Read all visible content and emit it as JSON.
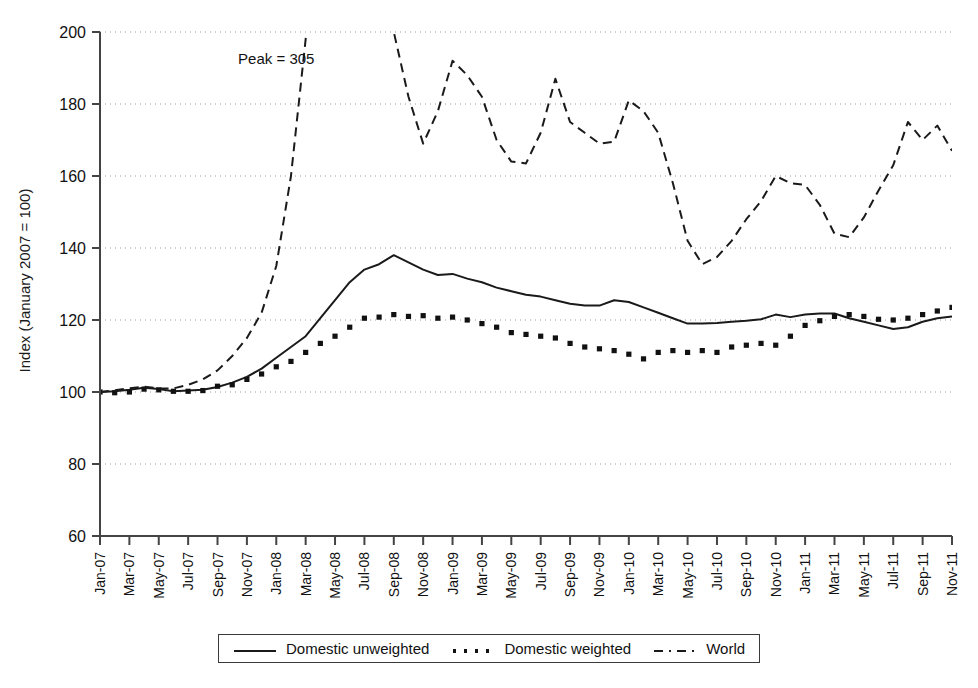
{
  "chart_data": {
    "type": "line",
    "title": "",
    "xlabel": "",
    "ylabel": "Index (January 2007 = 100)",
    "ylim": [
      60,
      200
    ],
    "yticks": [
      60,
      80,
      100,
      120,
      140,
      160,
      180,
      200
    ],
    "grid": true,
    "legend_position": "bottom",
    "annotations": [
      {
        "text": "Peak = 305",
        "x": "Jan-08",
        "y": 191
      }
    ],
    "x": [
      "Jan-07",
      "Feb-07",
      "Mar-07",
      "Apr-07",
      "May-07",
      "Jun-07",
      "Jul-07",
      "Aug-07",
      "Sep-07",
      "Oct-07",
      "Nov-07",
      "Dec-07",
      "Jan-08",
      "Feb-08",
      "Mar-08",
      "Apr-08",
      "May-08",
      "Jun-08",
      "Jul-08",
      "Aug-08",
      "Sep-08",
      "Oct-08",
      "Nov-08",
      "Dec-08",
      "Jan-09",
      "Feb-09",
      "Mar-09",
      "Apr-09",
      "May-09",
      "Jun-09",
      "Jul-09",
      "Aug-09",
      "Sep-09",
      "Oct-09",
      "Nov-09",
      "Dec-09",
      "Jan-10",
      "Feb-10",
      "Mar-10",
      "Apr-10",
      "May-10",
      "Jun-10",
      "Jul-10",
      "Aug-10",
      "Sep-10",
      "Oct-10",
      "Nov-10",
      "Dec-10",
      "Jan-11",
      "Feb-11",
      "Mar-11",
      "Apr-11",
      "May-11",
      "Jun-11",
      "Jul-11",
      "Aug-11",
      "Sep-11",
      "Oct-11",
      "Nov-11"
    ],
    "xtick_labels": [
      "Jan-07",
      "Mar-07",
      "May-07",
      "Jul-07",
      "Sep-07",
      "Nov-07",
      "Jan-08",
      "Mar-08",
      "May-08",
      "Jul-08",
      "Sep-08",
      "Nov-08",
      "Jan-09",
      "Mar-09",
      "May-09",
      "Jul-09",
      "Sep-09",
      "Nov-09",
      "Jan-10",
      "Mar-10",
      "May-10",
      "Jul-10",
      "Sep-10",
      "Nov-10",
      "Jan-11",
      "Mar-11",
      "May-11",
      "Jul-11",
      "Sep-11",
      "Nov-11"
    ],
    "series": [
      {
        "name": "Domestic unweighted",
        "style": "solid",
        "color": "#1a1a1a",
        "values": [
          100,
          100.2,
          100.6,
          101.2,
          100.8,
          100.2,
          100.4,
          100.6,
          101.4,
          102.6,
          104.2,
          106.5,
          109.5,
          112.5,
          115.5,
          120.5,
          125.5,
          130.5,
          134.0,
          135.5,
          138.0,
          136.0,
          134.0,
          132.5,
          132.8,
          131.5,
          130.5,
          129.0,
          128.0,
          127.0,
          126.5,
          125.5,
          124.5,
          124.0,
          124.0,
          125.5,
          125.0,
          123.5,
          122.0,
          120.5,
          119.0,
          119.0,
          119.2,
          119.5,
          119.8,
          120.2,
          121.5,
          120.8,
          121.5,
          121.8,
          121.8,
          120.5,
          119.5,
          118.5,
          117.5,
          118.0,
          119.5,
          120.5,
          121.0
        ]
      },
      {
        "name": "Domestic weighted",
        "style": "dotted",
        "color": "#111111",
        "values": [
          100,
          99.8,
          100.0,
          100.8,
          100.6,
          100.2,
          100.2,
          100.4,
          101.6,
          102.0,
          103.5,
          105.0,
          107.0,
          108.5,
          111.0,
          113.5,
          115.5,
          118.0,
          120.5,
          120.8,
          121.5,
          121.0,
          121.2,
          120.5,
          120.8,
          120.0,
          119.0,
          118.0,
          116.5,
          116.0,
          115.5,
          115.0,
          113.5,
          112.5,
          112.0,
          111.5,
          110.5,
          109.2,
          111.0,
          111.5,
          111.0,
          111.5,
          111.0,
          112.5,
          113.0,
          113.5,
          113.0,
          115.5,
          118.5,
          119.8,
          121.0,
          121.5,
          121.0,
          120.2,
          120.0,
          120.5,
          121.5,
          122.5,
          123.5
        ]
      },
      {
        "name": "World",
        "style": "dashed",
        "color": "#1a1a1a",
        "values": [
          100,
          100.5,
          101.0,
          101.5,
          101.0,
          101.0,
          102.0,
          103.5,
          106.0,
          110.0,
          115.0,
          122.0,
          135.0,
          160.0,
          198.0,
          240.0,
          270.0,
          295.0,
          305.0,
          250.0,
          200.0,
          182.0,
          169.0,
          178.0,
          192.0,
          188.0,
          182.0,
          170.0,
          164.0,
          163.5,
          172.0,
          187.0,
          175.0,
          172.0,
          169.0,
          169.5,
          181.0,
          178.0,
          172.0,
          158.0,
          142.0,
          135.5,
          137.5,
          142.0,
          148.0,
          153.0,
          160.0,
          158.0,
          157.5,
          152.0,
          144.0,
          143.0,
          148.5,
          156.0,
          163.0,
          175.0,
          170.0,
          174.0,
          167.0
        ]
      }
    ]
  },
  "legend": {
    "items": [
      {
        "label": "Domestic unweighted",
        "style": "solid"
      },
      {
        "label": "Domestic weighted",
        "style": "dotted"
      },
      {
        "label": "World",
        "style": "dashed"
      }
    ]
  },
  "axis": {
    "y_title": "Index (January 2007 = 100)"
  }
}
